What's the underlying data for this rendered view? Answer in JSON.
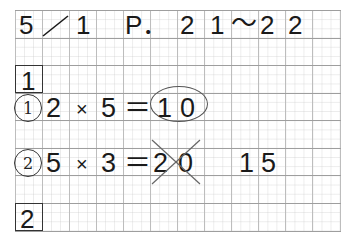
{
  "header": {
    "date": "5",
    "slash": "／",
    "month_day": "1",
    "page_label": "P．",
    "pages": [
      "2",
      "1",
      "〜",
      "2",
      "2"
    ]
  },
  "sections": [
    {
      "number": "1"
    },
    {
      "number": "2"
    }
  ],
  "problems": [
    {
      "marker": "1",
      "expr": [
        "2",
        "×",
        "5",
        "＝"
      ],
      "answer": [
        "1",
        "0"
      ],
      "answer_status": "circled-correct"
    },
    {
      "marker": "2",
      "expr": [
        "5",
        "×",
        "3",
        "＝"
      ],
      "wrong_answer": [
        "2",
        "0"
      ],
      "wrong_status": "crossed-out",
      "correction": [
        "1",
        "5"
      ]
    }
  ],
  "colors": {
    "ink": "#1a1a1a",
    "grid_major": "#9e9e9e",
    "grid_minor": "#dcdcdc"
  }
}
